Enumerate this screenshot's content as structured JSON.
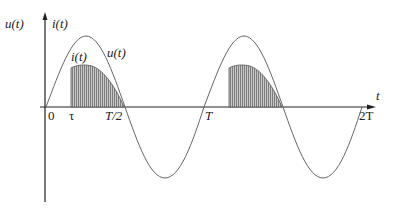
{
  "diagram": {
    "title": "",
    "y_axis_label_voltage": "u(t)",
    "y_axis_label_current": "i(t)",
    "x_axis_label": "t",
    "curve_labels": {
      "voltage": "u(t)",
      "current": "i(t)"
    },
    "tick_labels": [
      "0",
      "τ",
      "T/2",
      "T",
      "2T"
    ],
    "colors": {
      "line": "#555555",
      "hatch": "#777777",
      "fill": "#bdbdbd",
      "axis": "#222222"
    }
  }
}
